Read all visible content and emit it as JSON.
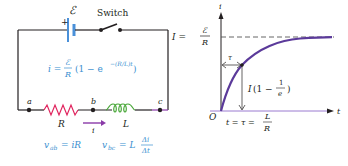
{
  "circuit": {
    "emf_label": "ℰ",
    "plus_sign": "+",
    "switch_label": "Switch",
    "current_equation": {
      "lhs": "i =",
      "frac_num": "ℰ",
      "frac_den": "R",
      "rest": "(1 − e",
      "exponent": "−(R/L)t",
      "close": ")"
    },
    "nodes": {
      "a": "a",
      "b": "b",
      "c": "c"
    },
    "resistor_label": "R",
    "inductor_label": "L",
    "current_arrow_label": "i",
    "vab_equation": "v",
    "vab_sub": "ab",
    "vab_rhs": "= iR",
    "vbc_equation": "v",
    "vbc_sub": "bc",
    "vbc_rhs": "= L",
    "vbc_frac_num": "Δi",
    "vbc_frac_den": "Δt"
  },
  "graph": {
    "y_axis_label": "i",
    "x_axis_label": "t",
    "origin_label": "O",
    "asymptote_lhs": "I =",
    "asymptote_num": "ℰ",
    "asymptote_den": "R",
    "tau_label": "τ",
    "point_label_I": "I",
    "point_label_open": "(1 −",
    "point_frac_num": "1",
    "point_frac_den": "e",
    "point_label_close": ")",
    "time_label": "t = τ =",
    "time_frac_num": "L",
    "time_frac_den": "R"
  },
  "colors": {
    "wire": "#231f20",
    "battery": "#4a90d9",
    "resistor": "#e0245e",
    "inductor": "#4aa83a",
    "current_arrow": "#8a3aa8",
    "equation": "#3a8fd0",
    "curve": "#5b3a9a",
    "axis_highlight": "#9a7ad0"
  }
}
